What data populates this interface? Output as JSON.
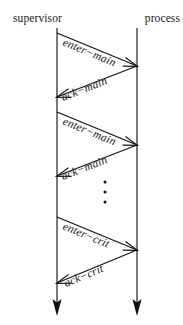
{
  "diagram": {
    "type": "sequence-diagram",
    "title": "",
    "background_color": "#ffffff",
    "line_color": "#111111",
    "width": 183,
    "height": 325,
    "participants": [
      {
        "id": "supervisor",
        "label": "supervisor",
        "lifeline_x": 57,
        "label_x": 13,
        "label_y": 22,
        "anchor": "start"
      },
      {
        "id": "process",
        "label": "process",
        "lifeline_x": 137,
        "label_x": 180,
        "label_y": 22,
        "anchor": "end"
      }
    ],
    "lifeline": {
      "top_y": 28,
      "bottom_y": 303,
      "terminator": "solid-arrowhead",
      "terminator_tip_y": 316
    },
    "messages": [
      {
        "index": 0,
        "label": "enter−main",
        "from": "supervisor",
        "to": "process",
        "direction": "left-to-right",
        "x1": 57,
        "y1": 33,
        "x2": 137,
        "y2": 66,
        "label_x": 62,
        "label_y": 45,
        "label_rotation": 22.4
      },
      {
        "index": 1,
        "label": "ack−main",
        "from": "process",
        "to": "supervisor",
        "direction": "right-to-left",
        "x1": 137,
        "y1": 66,
        "x2": 57,
        "y2": 97,
        "label_x": 63,
        "label_y": 101,
        "label_rotation": -21.2
      },
      {
        "index": 2,
        "label": "enter−main",
        "from": "supervisor",
        "to": "process",
        "direction": "left-to-right",
        "x1": 57,
        "y1": 112,
        "x2": 137,
        "y2": 145,
        "label_x": 62,
        "label_y": 124,
        "label_rotation": 22.4
      },
      {
        "index": 3,
        "label": "ack−main",
        "from": "process",
        "to": "supervisor",
        "direction": "right-to-left",
        "x1": 137,
        "y1": 145,
        "x2": 57,
        "y2": 176,
        "label_x": 63,
        "label_y": 180,
        "label_rotation": -21.2
      },
      {
        "index": 4,
        "label": "enter−crit",
        "from": "supervisor",
        "to": "process",
        "direction": "left-to-right",
        "x1": 57,
        "y1": 217,
        "x2": 137,
        "y2": 250,
        "label_x": 62,
        "label_y": 229,
        "label_rotation": 22.4
      },
      {
        "index": 5,
        "label": "ack−crit",
        "from": "process",
        "to": "supervisor",
        "direction": "right-to-left",
        "x1": 137,
        "y1": 250,
        "x2": 57,
        "y2": 283,
        "label_x": 66,
        "label_y": 287,
        "label_rotation": -22.4
      }
    ],
    "ellipsis": {
      "label": "vertical-ellipsis",
      "x": 105,
      "dot_radius": 1.5,
      "dots_y": [
        182,
        192,
        202
      ]
    }
  }
}
